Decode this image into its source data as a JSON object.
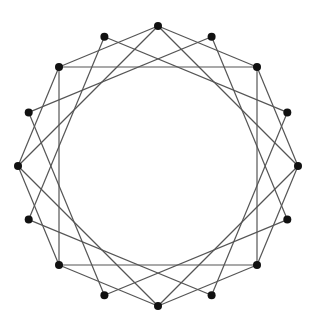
{
  "diagram": {
    "type": "graph",
    "center": [
      158,
      166
    ],
    "radius": 140,
    "vertex_count": 16,
    "start_angle_deg": -90,
    "vertex_radius": 4,
    "colors": {
      "edge": "#555555",
      "vertex": "#111111",
      "background": "#ffffff"
    },
    "edges": [
      [
        0,
        2
      ],
      [
        2,
        4
      ],
      [
        4,
        6
      ],
      [
        6,
        8
      ],
      [
        8,
        10
      ],
      [
        10,
        12
      ],
      [
        12,
        14
      ],
      [
        14,
        0
      ],
      [
        0,
        4
      ],
      [
        4,
        8
      ],
      [
        8,
        12
      ],
      [
        12,
        0
      ],
      [
        1,
        5
      ],
      [
        5,
        9
      ],
      [
        9,
        13
      ],
      [
        13,
        1
      ],
      [
        2,
        6
      ],
      [
        6,
        10
      ],
      [
        10,
        14
      ],
      [
        14,
        2
      ],
      [
        3,
        7
      ],
      [
        7,
        11
      ],
      [
        11,
        15
      ],
      [
        15,
        3
      ]
    ]
  }
}
